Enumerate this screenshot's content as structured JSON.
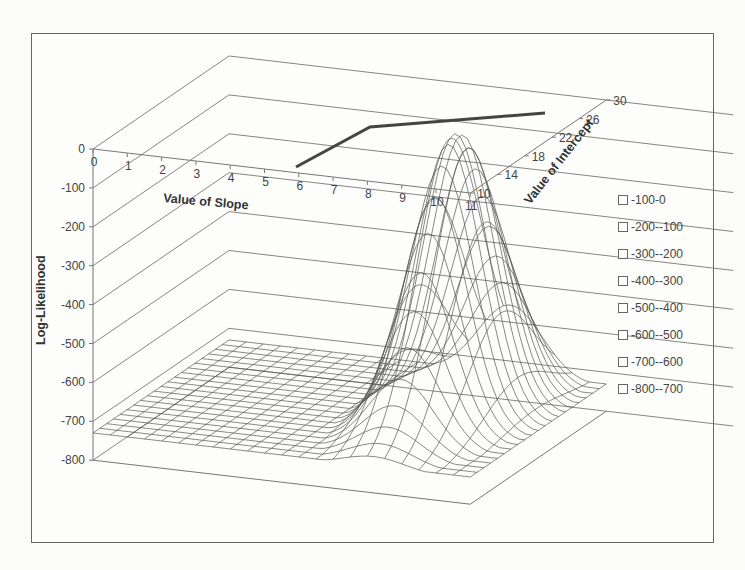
{
  "chart_data": {
    "type": "surface-3d-wireframe",
    "title": "",
    "xlabel": "Value of Slope",
    "ylabel": "Value of Intercept",
    "zlabel": "Log-Likelihood",
    "x_ticks": [
      "0",
      "1",
      "2",
      "3",
      "4",
      "5",
      "6",
      "7",
      "8",
      "9",
      "10",
      "11"
    ],
    "y_ticks": [
      "10",
      "14",
      "18",
      "22",
      "26",
      "30"
    ],
    "z_ticks": [
      "0",
      "-100",
      "-200",
      "-300",
      "-400",
      "-500",
      "-600",
      "-700",
      "-800"
    ],
    "x_range": [
      0,
      11
    ],
    "y_range": [
      10,
      30
    ],
    "z_range": [
      -800,
      0
    ],
    "grid": true,
    "legend_position": "right",
    "legend": [
      "-100-0",
      "-200--100",
      "-300--200",
      "-400--300",
      "-500--400",
      "-600--500",
      "-700--600",
      "-800--700"
    ],
    "surface_peak": {
      "slope": 8.2,
      "intercept": 22,
      "log_likelihood": -20
    },
    "surface_floor": -730,
    "overlay_line": {
      "description": "dark ridge line along maximum",
      "points": [
        {
          "slope": 6,
          "intercept": 10,
          "z": 0
        },
        {
          "slope": 8,
          "intercept": 22,
          "z": 0
        },
        {
          "slope": 11,
          "intercept": 26,
          "z": 0
        }
      ]
    }
  },
  "legend": {
    "items": [
      "-100-0",
      "-200--100",
      "-300--200",
      "-400--300",
      "-500--400",
      "-600--500",
      "-700--600",
      "-800--700"
    ]
  },
  "colors": {
    "frame": "#666666",
    "mesh": "#555555",
    "grid": "#777777",
    "ridge_line": "#444444"
  }
}
